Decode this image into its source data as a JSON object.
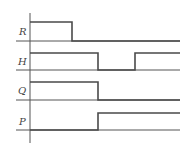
{
  "diagram": {
    "type": "timing-diagram",
    "colors": {
      "background": "#ffffff",
      "signal": "#4a4a4a",
      "baseline": "#555555",
      "axis": "#555555",
      "label": "#444444"
    },
    "axis": {
      "x": 30,
      "y_top": 13,
      "y_bottom": 143
    },
    "x_range": {
      "start": 16,
      "end": 180
    },
    "signals": [
      {
        "name": "R",
        "label": "R",
        "baseline_y": 41,
        "high_y": 22,
        "segments": [
          {
            "level": "high",
            "from": 30,
            "to": 72
          },
          {
            "level": "low",
            "from": 72,
            "to": 180
          }
        ]
      },
      {
        "name": "H",
        "label": "H",
        "baseline_y": 70,
        "high_y": 53,
        "segments": [
          {
            "level": "high",
            "from": 30,
            "to": 98
          },
          {
            "level": "low",
            "from": 98,
            "to": 135
          },
          {
            "level": "high",
            "from": 135,
            "to": 180
          }
        ]
      },
      {
        "name": "Q",
        "label": "Q",
        "baseline_y": 100,
        "high_y": 82,
        "segments": [
          {
            "level": "high",
            "from": 30,
            "to": 98
          },
          {
            "level": "low",
            "from": 98,
            "to": 180
          }
        ]
      },
      {
        "name": "P",
        "label": "P",
        "baseline_y": 130,
        "high_y": 113,
        "segments": [
          {
            "level": "low",
            "from": 30,
            "to": 98
          },
          {
            "level": "high",
            "from": 98,
            "to": 180
          }
        ]
      }
    ],
    "labels": [
      {
        "text": "R",
        "x": 19,
        "y": 35
      },
      {
        "text": "H",
        "x": 18,
        "y": 65
      },
      {
        "text": "Q",
        "x": 18,
        "y": 94
      },
      {
        "text": "P",
        "x": 19,
        "y": 125
      }
    ]
  }
}
